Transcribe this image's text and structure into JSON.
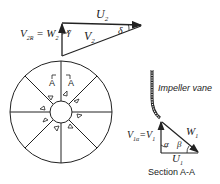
{
  "outlet_triangle": {
    "u2": "U",
    "u2_sub": "2",
    "v2": "V",
    "v2_sub": "2",
    "v2r_label": "V",
    "v2r_sub": "2R",
    "equals": " = W",
    "w2_sub": "2",
    "gamma": "γ",
    "delta": "δ"
  },
  "impeller": {
    "section_marker_left": "A",
    "section_marker_right": "A",
    "blade_count": 8
  },
  "inlet_triangle": {
    "vane_label": "Impeller vane",
    "v1a_label": "V",
    "v1a_sub": "1α",
    "equals_v1": "=V",
    "v1_sub": "1",
    "w1": "W",
    "w1_sub": "1",
    "u1": "U",
    "u1_sub": "1",
    "alpha": "α",
    "beta": "β",
    "section_caption": "Section A-A"
  }
}
